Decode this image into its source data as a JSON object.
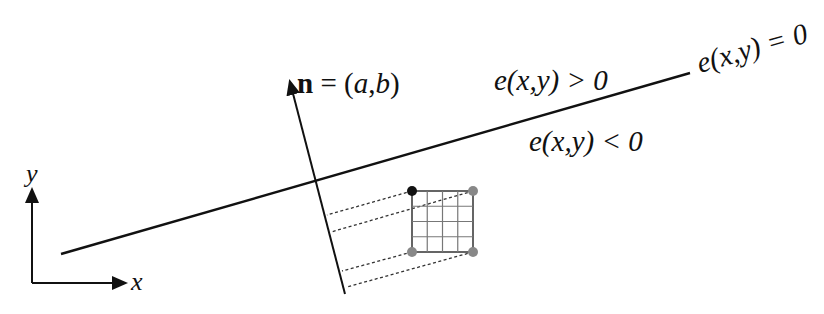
{
  "diagram": {
    "type": "edge-function-half-plane",
    "labels": {
      "normal_bold": "n",
      "normal_rest": " = (",
      "normal_a": "a",
      "normal_comma": ",",
      "normal_b": "b",
      "normal_close": ")",
      "positive_region": "e(x,y) > 0",
      "negative_region": "e(x,y) < 0",
      "edge_line": "e(x,y) = 0",
      "axis_x": "x",
      "axis_y": "y"
    },
    "edge_line": {
      "x1": 61,
      "y1": 254,
      "x2": 690,
      "y2": 73
    },
    "normal_vector": {
      "x1": 345,
      "y1": 294,
      "x2": 290,
      "y2": 80
    },
    "pixel_grid": {
      "x": 412,
      "y": 191,
      "size": 61,
      "cells": 4
    },
    "corner_dots": [
      {
        "cx": 412,
        "cy": 191,
        "color": "#111111"
      },
      {
        "cx": 473,
        "cy": 191,
        "color": "#888888"
      },
      {
        "cx": 412,
        "cy": 252,
        "color": "#888888"
      },
      {
        "cx": 473,
        "cy": 252,
        "color": "#888888"
      }
    ],
    "colors": {
      "line": "#111111",
      "grid": "#777777",
      "dashed": "#333333"
    }
  }
}
